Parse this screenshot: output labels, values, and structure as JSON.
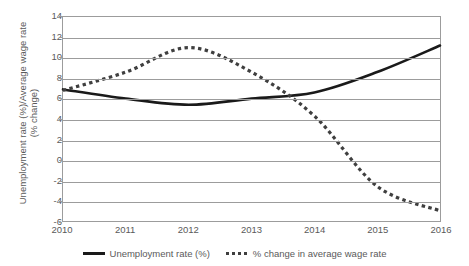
{
  "chart_data": {
    "type": "line",
    "title": "",
    "xlabel": "",
    "ylabel": "Unemployment rate (%)/Average wage rate (% change)",
    "ylabel_line1": "Unemployment rate (%)/Average wage rate",
    "ylabel_line2": "(% change)",
    "categories": [
      "2010",
      "2011",
      "2012",
      "2013",
      "2014",
      "2015",
      "2016"
    ],
    "x": [
      2010,
      2011,
      2012,
      2013,
      2014,
      2015,
      2016
    ],
    "xlim": [
      2010,
      2016
    ],
    "ylim": [
      -6,
      14
    ],
    "yticks": [
      -6,
      -4,
      -2,
      0,
      2,
      4,
      6,
      8,
      10,
      12,
      14
    ],
    "ytick_labels": [
      "-6",
      "-4",
      "-2",
      "0",
      "2",
      "4",
      "6",
      "8",
      "10",
      "12",
      "14"
    ],
    "grid": true,
    "legend_position": "bottom",
    "series": [
      {
        "name": "Unemployment rate (%)",
        "style": "solid",
        "color": "#1a1a1a",
        "values": [
          6.9,
          6.0,
          5.4,
          6.0,
          6.6,
          8.6,
          11.2
        ]
      },
      {
        "name": "% change in average wage rate",
        "style": "dotted",
        "color": "#3f3f3f",
        "values": [
          6.8,
          8.6,
          11.0,
          8.6,
          4.3,
          -2.6,
          -5.0
        ]
      }
    ]
  },
  "legend": {
    "items": [
      {
        "label": "Unemployment rate (%)",
        "style": "solid"
      },
      {
        "label": "% change in average wage rate",
        "style": "dotted"
      }
    ]
  }
}
